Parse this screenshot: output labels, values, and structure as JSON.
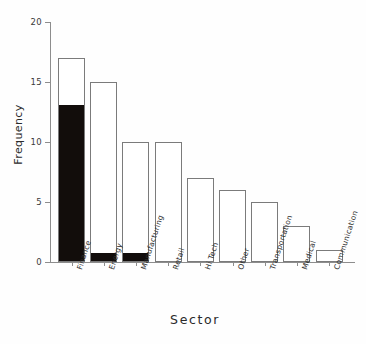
{
  "chart_data": {
    "type": "bar",
    "title": "",
    "subtitle": "",
    "xlabel": "Sector",
    "ylabel": "Frequency",
    "categories": [
      "Finance",
      "Energy",
      "Manufacturing",
      "Retail",
      "Hi Tech",
      "Other",
      "Transportation",
      "Medical",
      "Communication"
    ],
    "values": [
      17,
      15,
      10,
      10,
      7,
      6,
      5,
      3,
      1
    ],
    "series": [
      {
        "name": "Total",
        "values": [
          17,
          15,
          10,
          10,
          7,
          6,
          5,
          3,
          1
        ]
      },
      {
        "name": "Filled portion",
        "values": [
          13,
          0.7,
          0.7,
          0,
          0,
          0,
          0,
          0,
          0
        ]
      }
    ],
    "ylim": [
      0,
      20
    ],
    "yticks": [
      0,
      5,
      10,
      15,
      20
    ],
    "ytick_labels": [
      "0",
      "5",
      "10",
      "15",
      "20"
    ],
    "grid": false,
    "legend": false,
    "legend_position": "none",
    "bar_outline_color": "#7b7b7b",
    "bar_fill_color": "#120d0b",
    "bar_background_color": "#ffffff",
    "axis_color": "#8d8d8d",
    "background_color": "#ffffff"
  },
  "axes": {
    "y_title": "Frequency",
    "x_title": "Sector"
  }
}
